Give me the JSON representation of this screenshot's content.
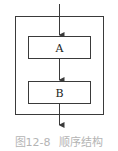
{
  "diagram": {
    "type": "flowchart",
    "blocks": [
      {
        "id": "A",
        "label": "A"
      },
      {
        "id": "B",
        "label": "B"
      }
    ],
    "colors": {
      "stroke": "#3a3a3a",
      "caption": "#b4b4b4"
    }
  },
  "caption": {
    "number": "图12-8",
    "title": "顺序结构"
  }
}
